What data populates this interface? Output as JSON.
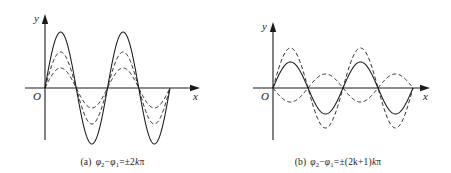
{
  "figure": {
    "background_color": "#ffffff",
    "stroke_color": "#1a1a1a"
  },
  "panels": [
    {
      "id": "a",
      "caption_tag": "(a)",
      "caption_text_plain": "φ2 − φ1 = ±2kπ",
      "caption_parts": {
        "phi2": "φ",
        "sub2": "2",
        "minus": "−",
        "phi1": "φ",
        "sub1": "1",
        "equals": "=",
        "rhs": "±2",
        "k": "k",
        "pi": "π"
      },
      "axes": {
        "y_label": "y",
        "x_label": "x",
        "origin_label": "O",
        "y_axis_x": 45,
        "x_axis_y": 88,
        "x_axis_start": 25,
        "x_axis_end": 200,
        "y_axis_top": 14,
        "y_axis_bottom": 140
      },
      "chart_data": {
        "type": "line",
        "title": "In-phase superposition",
        "xlabel": "x",
        "ylabel": "y",
        "xlim": [
          0,
          2
        ],
        "ylim": [
          -60,
          60
        ],
        "grid": false,
        "legend": "none",
        "x_unit": "periods",
        "zero_crossings_px": [
          45,
          88,
          132,
          170
        ],
        "series": [
          {
            "name": "resultant-wave",
            "style": "solid",
            "amplitude_px": 56,
            "phase_deg": 0,
            "periods": 2,
            "description": "solid large-amplitude sine, sum of the two components"
          },
          {
            "name": "component-wave-1",
            "style": "dashed",
            "amplitude_px": 36,
            "phase_deg": 0,
            "periods": 2,
            "description": "dashed medium-amplitude sine, in phase"
          },
          {
            "name": "component-wave-2",
            "style": "dashed",
            "amplitude_px": 20,
            "phase_deg": 0,
            "periods": 2,
            "description": "dashed small-amplitude sine, in phase"
          }
        ]
      }
    },
    {
      "id": "b",
      "caption_tag": "(b)",
      "caption_text_plain": "φ2 − φ1 = ±(2k+1)π",
      "caption_parts": {
        "phi2": "φ",
        "sub2": "2",
        "minus": "−",
        "phi1": "φ",
        "sub1": "1",
        "equals": "=",
        "rhs": "±(2k+1)",
        "k": "k",
        "pi": "π"
      },
      "axes": {
        "y_label": "y",
        "x_label": "x",
        "origin_label": "O",
        "y_axis_x": 48,
        "x_axis_y": 88,
        "x_axis_start": 28,
        "x_axis_end": 205,
        "y_axis_top": 22,
        "y_axis_bottom": 140
      },
      "chart_data": {
        "type": "line",
        "title": "Anti-phase superposition",
        "xlabel": "x",
        "ylabel": "y",
        "xlim": [
          0,
          2
        ],
        "ylim": [
          -45,
          45
        ],
        "grid": false,
        "legend": "none",
        "x_unit": "periods",
        "zero_crossings_px": [
          48,
          95,
          142,
          188
        ],
        "series": [
          {
            "name": "component-wave-1",
            "style": "dashed",
            "amplitude_px": 40,
            "phase_deg": 0,
            "periods": 2,
            "description": "dashed large-amplitude sine"
          },
          {
            "name": "resultant-wave",
            "style": "solid",
            "amplitude_px": 26,
            "phase_deg": 0,
            "periods": 2,
            "description": "solid medium-amplitude sine, the difference of the components"
          },
          {
            "name": "component-wave-2",
            "style": "dashed",
            "amplitude_px": 14,
            "phase_deg": 180,
            "periods": 2,
            "description": "dashed small-amplitude sine, inverted (anti-phase)"
          }
        ]
      }
    }
  ]
}
